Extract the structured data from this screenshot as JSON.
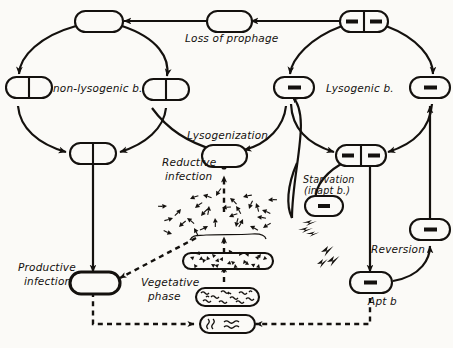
{
  "diagram": {
    "background_color": "#fbfaf7",
    "ink_color": "#14110e",
    "labels": {
      "loss_of_prophage": "Loss of prophage",
      "non_lysogenic": "non-lysogenic b.",
      "lysogenic": "Lysogenic b.",
      "lysogenization": "Lysogenization",
      "reductive_infection_line1": "Reductive",
      "reductive_infection_line2": "infection",
      "starvation_line1": "Starvation",
      "starvation_line2": "(inapt b.)",
      "reversion": "Reversion",
      "apt_b": "Apt b",
      "productive_infection_line1": "Productive",
      "productive_infection_line2": "infection",
      "vegetative_phase_line1": "Vegetative",
      "vegetative_phase_line2": "phase"
    },
    "nodes": [
      {
        "id": "nl-top",
        "name": "non-lysogenic-top-cell",
        "type": "plain-cell"
      },
      {
        "id": "nl-left",
        "name": "non-lysogenic-left-dividing-cell",
        "type": "dividing-cell"
      },
      {
        "id": "nl-right",
        "name": "non-lysogenic-right-dividing-cell",
        "type": "dividing-cell"
      },
      {
        "id": "nl-bottom",
        "name": "non-lysogenic-bottom-dividing-cell",
        "type": "dividing-cell"
      },
      {
        "id": "transit",
        "name": "loss-of-prophage-transit-cell",
        "type": "plain-cell"
      },
      {
        "id": "ly-top",
        "name": "lysogenic-top-dividing-cell",
        "type": "dividing-cell-prophage"
      },
      {
        "id": "ly-left",
        "name": "lysogenic-left-cell",
        "type": "prophage-cell"
      },
      {
        "id": "ly-right",
        "name": "lysogenic-right-cell",
        "type": "prophage-cell"
      },
      {
        "id": "ly-bottom",
        "name": "lysogenic-bottom-dividing-cell",
        "type": "dividing-cell-prophage"
      },
      {
        "id": "inapt",
        "name": "inapt-bacterium-cell",
        "type": "prophage-cell"
      },
      {
        "id": "apt",
        "name": "apt-bacterium-cell",
        "type": "prophage-cell"
      },
      {
        "id": "rev-mid",
        "name": "reversion-intermediate-cell",
        "type": "prophage-cell"
      },
      {
        "id": "lysogenization-cell",
        "name": "lysogenization-product-cell",
        "type": "plain-cell"
      },
      {
        "id": "productive-cell",
        "name": "productive-infection-cell",
        "type": "plain-cell-thick"
      },
      {
        "id": "burst",
        "name": "phage-burst-cluster",
        "type": "phage-cluster"
      },
      {
        "id": "filled-cell",
        "name": "phage-filled-lysing-cell",
        "type": "filled-cell"
      },
      {
        "id": "veg-cell",
        "name": "vegetative-phase-cell",
        "type": "squiggle-cell"
      },
      {
        "id": "infecting-cell",
        "name": "infecting-phage-dna-cell",
        "type": "small-squiggle-cell"
      }
    ],
    "edges": [
      {
        "name": "edge-transit-to-nonlysogenic",
        "style": "solid"
      },
      {
        "name": "edge-lysogenic-to-transit",
        "style": "solid"
      },
      {
        "name": "edge-nonlysogenic-cycle",
        "style": "solid"
      },
      {
        "name": "edge-lysogenic-cycle",
        "style": "solid"
      },
      {
        "name": "edge-lysogenization",
        "style": "solid"
      },
      {
        "name": "edge-reductive-infection",
        "style": "dashed"
      },
      {
        "name": "edge-productive-infection",
        "style": "solid"
      },
      {
        "name": "edge-phage-release",
        "style": "dashed"
      },
      {
        "name": "edge-vegetative-progression",
        "style": "dashed"
      },
      {
        "name": "edge-starvation",
        "style": "solid"
      },
      {
        "name": "edge-reversion",
        "style": "solid"
      },
      {
        "name": "edge-apt-recycle",
        "style": "dashed"
      }
    ]
  }
}
